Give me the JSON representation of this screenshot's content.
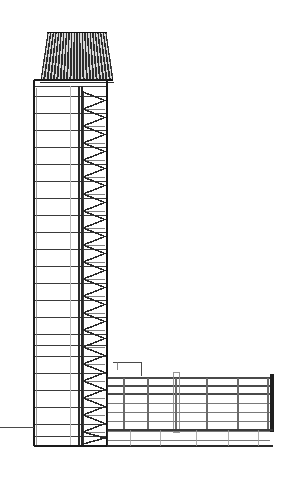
{
  "document": {
    "type": "architectural-drawing",
    "drawing_kind": "building-section-elevation",
    "subject": "high-rise-tower-with-low-rise-wing",
    "caption": "",
    "background_color": "#ffffff",
    "ink_color": "#1a1a1a",
    "light_ink_color": "#9a9a9a",
    "mid_ink_color": "#5a5a5a",
    "canvas": {
      "width": 284,
      "height": 477
    }
  },
  "drawing": {
    "crown": {
      "label": "mechanical-louvered-crown",
      "left": 41,
      "right": 113,
      "top": 32,
      "bottom": 80,
      "top_inset": 7,
      "fill": "#2e2e2e",
      "louver_count": 22,
      "louver_light": "#d8d8d8",
      "cap_line_y": 35
    },
    "tower": {
      "label": "tower-shaft",
      "left": 34,
      "right": 107,
      "top": 80,
      "bottom": 446,
      "wall_stroke": "#1a1a1a",
      "wall_width": 1.4,
      "slab_stroke": "#3a3a3a",
      "slab_width": 1.0,
      "floor_lines_y": [
        86,
        96,
        113,
        130,
        147,
        164,
        181,
        198,
        215,
        232,
        249,
        266,
        283,
        300,
        317,
        334,
        345,
        356,
        373,
        390,
        407,
        424,
        436
      ],
      "core_lines_x": [
        {
          "x": 70,
          "color": "#b8b8b8",
          "width": 1.0
        },
        {
          "x": 79,
          "color": "#2a2a2a",
          "width": 1.1
        },
        {
          "x": 82,
          "color": "#2a2a2a",
          "width": 1.1
        }
      ],
      "stair_zone": {
        "label": "stair-brace-zone",
        "left": 83,
        "right": 105,
        "top": 92,
        "bottom": 444,
        "step_height": 17,
        "stroke": "#2a2a2a",
        "stroke_width": 1.5
      },
      "right_pier": {
        "x": 105.5,
        "width": 2.0,
        "color": "#141414"
      }
    },
    "ground": {
      "label": "ground-line",
      "y": 427,
      "from_x": 0,
      "to_x": 34,
      "stroke": "#4a4a4a",
      "width": 1.0
    },
    "wing": {
      "label": "low-rise-wing",
      "left": 107,
      "right": 273,
      "roof_top": 376,
      "base_y": 446,
      "end_pier": {
        "x": 270,
        "width": 4,
        "top": 374,
        "bottom": 432,
        "color": "#1f1f1f"
      },
      "roof_beams_y": [
        378,
        386,
        394
      ],
      "beam_stroke": "#4a4a4a",
      "beam_width": 1.6,
      "floor_lines_y": [
        403,
        412,
        421,
        431,
        440
      ],
      "columns_x": [
        124,
        148,
        176,
        207,
        238,
        268
      ],
      "column_top": 378,
      "column_bottom": 430,
      "column_stroke": "#6a6a6a",
      "column_width": 1.4,
      "podium": {
        "label": "podium-slab",
        "left": 107,
        "right": 273,
        "top": 430,
        "bottom": 446
      },
      "canopy": {
        "label": "entry-canopy",
        "x1": 113,
        "y1": 362,
        "x2": 141,
        "y2": 362
      },
      "mechanical_stack": {
        "label": "mechanical-riser",
        "x": 176,
        "top": 372,
        "bottom": 432,
        "width": 6,
        "color": "#8a8a8a"
      }
    }
  },
  "annotations": {
    "visible_text": [],
    "note": ""
  }
}
